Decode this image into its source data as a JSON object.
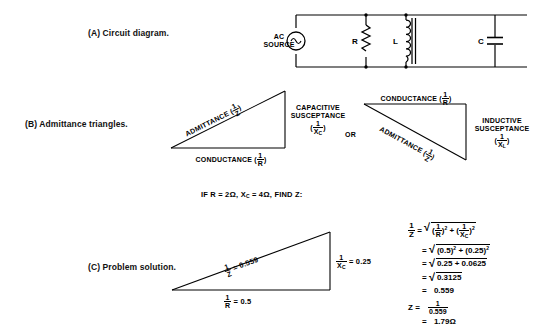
{
  "figure": {
    "title_parts": [
      "Circuit diagram",
      "Admittance triangles",
      "Problem solution"
    ]
  },
  "captions": {
    "a": "(A) Circuit diagram.",
    "b": "(B) Admittance triangles.",
    "c": "(C) Problem solution."
  },
  "circuit": {
    "source_line1": "AC",
    "source_line2": "SOURCE",
    "source_icon": "ac-sine-source-icon",
    "resistor_label": "R",
    "resistor_icon": "resistor-zigzag-icon",
    "inductor_label": "L",
    "inductor_icon": "iron-core-inductor-icon",
    "capacitor_label": "C",
    "capacitor_icon": "capacitor-icon"
  },
  "triangle_left": {
    "hypotenuse_label": "ADMITTANCE",
    "hypotenuse_frac_num": "1",
    "hypotenuse_frac_den": "Z",
    "vertical_line1": "CAPACITIVE",
    "vertical_line2": "SUSCEPTANCE",
    "vertical_frac_num": "1",
    "vertical_frac_den": "X",
    "vertical_frac_den_sub": "C",
    "base_label": "CONDUCTANCE",
    "base_frac_num": "1",
    "base_frac_den": "R"
  },
  "or_label": "OR",
  "triangle_right": {
    "top_label": "CONDUCTANCE",
    "top_frac_num": "1",
    "top_frac_den": "R",
    "vertical_line1": "INDUCTIVE",
    "vertical_line2": "SUSCEPTANCE",
    "vertical_frac_num": "1",
    "vertical_frac_den": "X",
    "vertical_frac_den_sub": "L",
    "hypotenuse_label": "ADMITTANCE",
    "hypotenuse_frac_num": "1",
    "hypotenuse_frac_den": "Z"
  },
  "problem_statement": {
    "prefix": "IF R = 2",
    "ohm1": "Ω",
    "mid": ", X",
    "sub": "C",
    "mid2": " = 4",
    "ohm2": "Ω",
    "suffix": ", FIND Z:",
    "full_text": "IF R = 2Ω, X_C = 4Ω, FIND Z:"
  },
  "solution_triangle": {
    "hyp_num": "1",
    "hyp_den": "Z",
    "hyp_value": "= 0.559",
    "vert_num": "1",
    "vert_den": "X",
    "vert_den_sub": "C",
    "vert_value": "= 0.25",
    "base_num": "1",
    "base_den": "R",
    "base_value": "= 0.5"
  },
  "equations": {
    "lhs_num": "1",
    "lhs_den": "Z",
    "line1": {
      "eq": "=",
      "radicand_a_num": "1",
      "radicand_a_den": "R",
      "exp_a": "2",
      "plus": "+",
      "radicand_b_num": "1",
      "radicand_b_den": "X",
      "radicand_b_den_sub": "C",
      "exp_b": "2",
      "text": "= √[(1/R)² + (1/X_C)²]"
    },
    "line2": {
      "eq": "=",
      "text": "√(0.5)² + (0.25)²",
      "a": "(0.5)",
      "exp_a": "2",
      "plus": "+",
      "b": "(0.25)",
      "exp_b": "2"
    },
    "line3": {
      "eq": "=",
      "text": "0.25  +  0.0625",
      "radicand": "0.25 + 0.0625"
    },
    "line4": {
      "eq": "=",
      "radicand": "0.3125"
    },
    "line5": {
      "eq": "=",
      "value": "0.559"
    },
    "line6": {
      "lhs": "Z",
      "eq": "=",
      "num": "1",
      "den": "0.559"
    },
    "line7": {
      "eq": "=",
      "value": "1.79",
      "unit": "Ω"
    }
  },
  "colors": {
    "ink": "#000000",
    "background": "#ffffff"
  }
}
